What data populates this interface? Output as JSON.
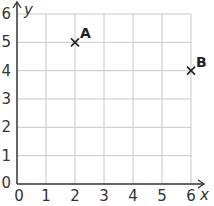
{
  "chart_data": {
    "type": "scatter",
    "title": "",
    "xlabel": "x",
    "ylabel": "y",
    "xlim": [
      0,
      6
    ],
    "ylim": [
      0,
      6
    ],
    "grid": true,
    "x_ticks": [
      "0",
      "1",
      "2",
      "3",
      "4",
      "5",
      "6"
    ],
    "y_ticks": [
      "0",
      "1",
      "2",
      "3",
      "4",
      "5",
      "6"
    ],
    "points": [
      {
        "label": "A",
        "x": 2,
        "y": 5,
        "marker": "x"
      },
      {
        "label": "B",
        "x": 6,
        "y": 4,
        "marker": "x"
      }
    ]
  },
  "colors": {
    "grid": "#c8c8c8",
    "axis": "#333333",
    "marker": "#222222"
  }
}
